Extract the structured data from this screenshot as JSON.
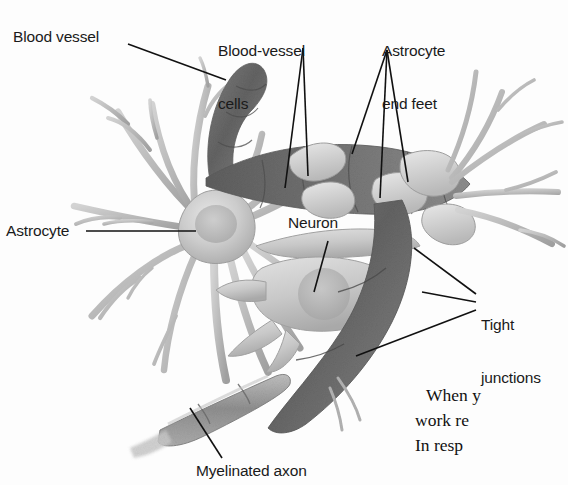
{
  "page": {
    "kind": "textbook-figure-scan",
    "background_color": "#fdfdfd",
    "width": 568,
    "height": 485
  },
  "figure": {
    "title_alt": "Blood-brain barrier: astrocyte, neuron and capillary diagram",
    "label_color": "#1a1a1a",
    "leader_line_color": "#111111",
    "palette": {
      "vessel_dark": "#6c6c6c",
      "vessel_mid": "#8a8a8a",
      "cell_light": "#cfcfcf",
      "cell_mid": "#b4b4b4",
      "outline": "#8e8e8e",
      "nucleus": "#b0b0b0",
      "myelin": "#9a9a9a"
    },
    "labels": [
      {
        "id": "blood-vessel",
        "text": "Blood vessel"
      },
      {
        "id": "blood-vessel-cells",
        "line1": "Blood-vessel",
        "line2": "cells"
      },
      {
        "id": "astrocyte-end-feet",
        "line1": "Astrocyte",
        "line2": "end feet"
      },
      {
        "id": "astrocyte",
        "text": "Astrocyte"
      },
      {
        "id": "neuron",
        "text": "Neuron"
      },
      {
        "id": "tight-junctions",
        "line1": "Tight",
        "line2": "junctions"
      },
      {
        "id": "myelinated-axon",
        "text": "Myelinated axon"
      }
    ]
  },
  "labels": {
    "blood_vessel": "Blood vessel",
    "blood_vessel_cells_line1": "Blood-vessel",
    "blood_vessel_cells_line2": "cells",
    "astrocyte_end_feet_line1": "Astrocyte",
    "astrocyte_end_feet_line2": "end feet",
    "astrocyte": "Astrocyte",
    "neuron": "Neuron",
    "tight_junctions_line1": "Tight",
    "tight_junctions_line2": "junctions",
    "myelinated_axon": "Myelinated axon"
  },
  "body_text": {
    "line1": "When y",
    "line2": "work re",
    "line3": "In resp"
  }
}
